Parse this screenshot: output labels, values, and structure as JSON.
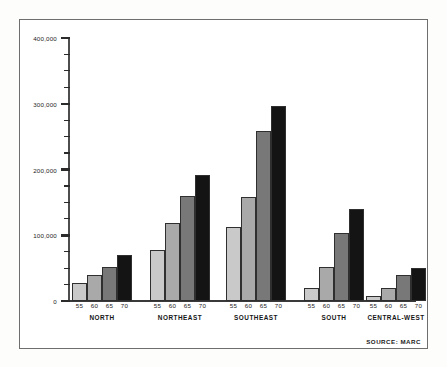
{
  "figure": {
    "source_note": "SOURCE: MARC",
    "background_color": "#ffffff",
    "frame_color": "#6e6e6e"
  },
  "chart_data": {
    "type": "bar",
    "title": "",
    "subtitle": "",
    "xlabel": "",
    "ylabel": "",
    "ylim": [
      0,
      400000
    ],
    "grid": false,
    "legend_position": "none",
    "y_major_ticks": [
      0,
      100000,
      200000,
      300000,
      400000
    ],
    "y_major_tick_labels": [
      "0",
      "100,000",
      "200,000",
      "300,000",
      "400,000"
    ],
    "y_minor_tick_interval": 25000,
    "categories": [
      "NORTH",
      "NORTHEAST",
      "SOUTHEAST",
      "SOUTH",
      "CENTRAL-WEST"
    ],
    "x": [
      "55",
      "60",
      "65",
      "70"
    ],
    "series": [
      {
        "name": "55",
        "color": "#c9c9c9",
        "values": [
          27000,
          78000,
          112000,
          20000,
          8000
        ]
      },
      {
        "name": "60",
        "color": "#a9a9a9",
        "values": [
          40000,
          118000,
          158000,
          52000,
          20000
        ]
      },
      {
        "name": "65",
        "color": "#787878",
        "values": [
          52000,
          160000,
          258000,
          103000,
          40000
        ]
      },
      {
        "name": "70",
        "color": "#141414",
        "values": [
          70000,
          192000,
          296000,
          140000,
          50000
        ]
      }
    ],
    "groups": [
      {
        "label": "NORTH",
        "bars": [
          {
            "x": "55",
            "value": 27000,
            "color": "#c9c9c9"
          },
          {
            "x": "60",
            "value": 40000,
            "color": "#a9a9a9"
          },
          {
            "x": "65",
            "value": 52000,
            "color": "#787878"
          },
          {
            "x": "70",
            "value": 70000,
            "color": "#141414"
          }
        ]
      },
      {
        "label": "NORTHEAST",
        "bars": [
          {
            "x": "55",
            "value": 78000,
            "color": "#c9c9c9"
          },
          {
            "x": "60",
            "value": 118000,
            "color": "#a9a9a9"
          },
          {
            "x": "65",
            "value": 160000,
            "color": "#787878"
          },
          {
            "x": "70",
            "value": 192000,
            "color": "#141414"
          }
        ]
      },
      {
        "label": "SOUTHEAST",
        "bars": [
          {
            "x": "55",
            "value": 112000,
            "color": "#c9c9c9"
          },
          {
            "x": "60",
            "value": 158000,
            "color": "#a9a9a9"
          },
          {
            "x": "65",
            "value": 258000,
            "color": "#787878"
          },
          {
            "x": "70",
            "value": 296000,
            "color": "#141414"
          }
        ]
      },
      {
        "label": "SOUTH",
        "bars": [
          {
            "x": "55",
            "value": 20000,
            "color": "#c9c9c9"
          },
          {
            "x": "60",
            "value": 52000,
            "color": "#a9a9a9"
          },
          {
            "x": "65",
            "value": 103000,
            "color": "#787878"
          },
          {
            "x": "70",
            "value": 140000,
            "color": "#141414"
          }
        ]
      },
      {
        "label": "CENTRAL-WEST",
        "bars": [
          {
            "x": "55",
            "value": 8000,
            "color": "#c9c9c9"
          },
          {
            "x": "60",
            "value": 20000,
            "color": "#a9a9a9"
          },
          {
            "x": "65",
            "value": 40000,
            "color": "#787878"
          },
          {
            "x": "70",
            "value": 50000,
            "color": "#141414"
          }
        ]
      }
    ]
  }
}
